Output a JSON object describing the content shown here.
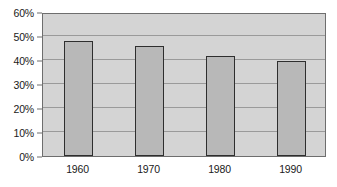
{
  "chart_data": {
    "type": "bar",
    "title": "",
    "xlabel": "",
    "ylabel": "",
    "categories": [
      "1960",
      "1970",
      "1980",
      "1990"
    ],
    "values": [
      48,
      46,
      41.5,
      39.5
    ],
    "value_format": "percent",
    "ylim": [
      0,
      60
    ],
    "ytick_labels": [
      "0%",
      "10%",
      "20%",
      "30%",
      "40%",
      "50%",
      "60%"
    ],
    "ytick_values": [
      0,
      10,
      20,
      30,
      40,
      50,
      60
    ],
    "grid": true,
    "legend": "none",
    "colors": {
      "bar_fill": "#b8b8b8",
      "bar_border": "#2e2e2e",
      "plot_background": "#d4d4d4",
      "gridline": "#9a9a9a",
      "axis_line": "#6e6e6e",
      "text": "#1a1a1a",
      "page_background": "#ffffff"
    }
  }
}
